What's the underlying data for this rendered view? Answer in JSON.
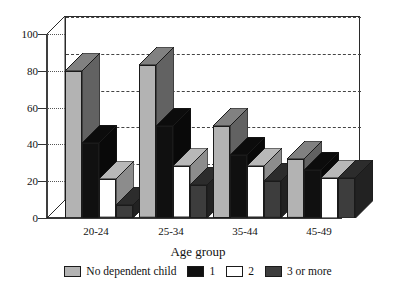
{
  "chart_data": {
    "type": "bar",
    "title": "",
    "xlabel": "Age group",
    "ylabel": "",
    "categories": [
      "20-24",
      "25-34",
      "35-44",
      "45-49"
    ],
    "ylim": [
      0,
      100
    ],
    "yticks": [
      0,
      20,
      40,
      60,
      80,
      100
    ],
    "grid": true,
    "legend_position": "bottom",
    "style": "3d-grouped-bar",
    "series": [
      {
        "name": "No dependent child",
        "color": "#b3b3b3",
        "values": [
          80,
          83,
          50,
          32
        ]
      },
      {
        "name": "1",
        "color": "#101010",
        "values": [
          41,
          50,
          34,
          26
        ]
      },
      {
        "name": "2",
        "color": "#ffffff",
        "values": [
          21,
          28,
          28,
          22
        ]
      },
      {
        "name": "3 or more",
        "color": "#3d3d3d",
        "values": [
          7,
          18,
          20,
          22
        ]
      }
    ]
  },
  "axes": {
    "x_title": "Age group",
    "x_tick_labels": [
      "20-24",
      "25-34",
      "35-44",
      "45-49"
    ],
    "y_tick_labels": [
      "0",
      "20",
      "40",
      "60",
      "80",
      "100"
    ]
  },
  "legend": {
    "items": [
      {
        "label": "No dependent child",
        "color": "#b3b3b3"
      },
      {
        "label": "1",
        "color": "#101010"
      },
      {
        "label": "2",
        "color": "#ffffff"
      },
      {
        "label": "3 or more",
        "color": "#3d3d3d"
      }
    ]
  }
}
